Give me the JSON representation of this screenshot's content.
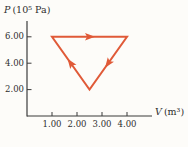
{
  "figure": {
    "background": "#fdfcf9",
    "axis_color": "#3b3b3b",
    "text_color": "#2e2e2e",
    "process_color": "#e05a38"
  },
  "chart_data": {
    "type": "line",
    "title": "",
    "xlabel": "V (m³)",
    "xlabel_symbol": "V",
    "xlabel_unit": "(m³)",
    "ylabel": "P (10⁵ Pa)",
    "ylabel_symbol": "P",
    "ylabel_unit": "(10⁵ Pa)",
    "x_ticks": [
      1.0,
      2.0,
      3.0,
      4.0
    ],
    "x_tick_labels": [
      "1.00",
      "2.00",
      "3.00",
      "4.00"
    ],
    "y_ticks": [
      2.0,
      4.0,
      6.0
    ],
    "y_tick_labels": [
      "2.00",
      "4.00",
      "6.00"
    ],
    "xlim": [
      0,
      5.0
    ],
    "ylim": [
      0,
      7.2
    ],
    "grid": false,
    "legend": false,
    "series": [
      {
        "name": "cyclic process",
        "shape": "closed-triangle",
        "direction": "clockwise",
        "points_V_P": [
          [
            1.0,
            6.0
          ],
          [
            4.0,
            6.0
          ],
          [
            2.5,
            2.0
          ]
        ],
        "arrows_at_edge_midpoints": true
      }
    ]
  }
}
